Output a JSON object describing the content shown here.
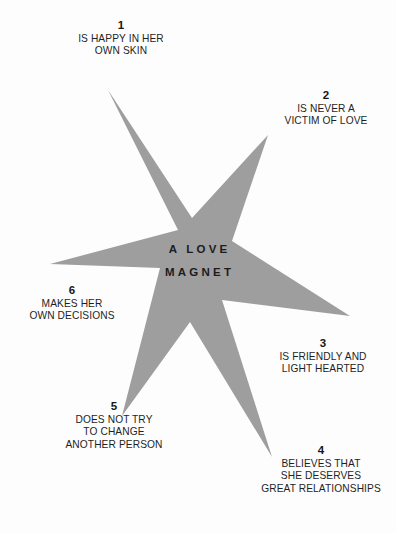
{
  "figure": {
    "title_lines": [
      "A LOVE",
      "MAGNET"
    ],
    "star_color": "#9e9e9e",
    "background_color": "#fdfdfd",
    "text_color": "#1f1f1f",
    "points": 6
  },
  "callouts": [
    {
      "number": "1",
      "lines": [
        "IS HAPPY IN HER",
        "OWN SKIN"
      ],
      "position": "top"
    },
    {
      "number": "2",
      "lines": [
        "IS NEVER A",
        "VICTIM OF LOVE"
      ],
      "position": "upper-right"
    },
    {
      "number": "3",
      "lines": [
        "IS FRIENDLY AND",
        "LIGHT HEARTED"
      ],
      "position": "lower-right"
    },
    {
      "number": "4",
      "lines": [
        "BELIEVES THAT",
        "SHE DESERVES",
        "GREAT RELATIONSHIPS"
      ],
      "position": "bottom-right"
    },
    {
      "number": "5",
      "lines": [
        "DOES NOT TRY",
        "TO CHANGE",
        "ANOTHER PERSON"
      ],
      "position": "bottom-left"
    },
    {
      "number": "6",
      "lines": [
        "MAKES HER",
        "OWN DECISIONS"
      ],
      "position": "left"
    }
  ]
}
